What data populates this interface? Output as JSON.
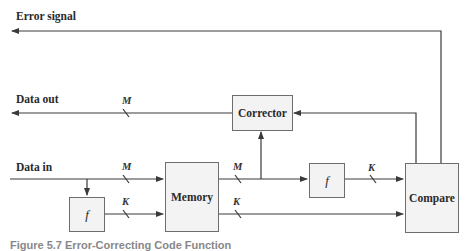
{
  "labels": {
    "error_signal": "Error signal",
    "data_out": "Data out",
    "data_in": "Data in"
  },
  "blocks": {
    "corrector": "Corrector",
    "memory": "Memory",
    "compare": "Compare",
    "f_input": "f",
    "f_output": "f"
  },
  "bus_widths": {
    "data_out": "M",
    "data_in": "M",
    "f_to_memory": "K",
    "memory_data": "M",
    "memory_check": "K",
    "f_to_compare": "K"
  },
  "caption": "Figure 5.7  Error-Correcting Code Function"
}
